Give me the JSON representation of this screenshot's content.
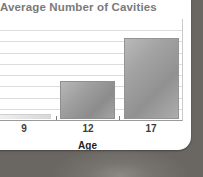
{
  "card": {
    "background_color": "#ffffff",
    "backdrop_color": "#6d6a66"
  },
  "chart_data": {
    "type": "bar",
    "title": "Average Number of Cavities",
    "categories": [
      "9",
      "12",
      "17"
    ],
    "values": [
      0.4,
      3.0,
      6.5
    ],
    "xlabel": "Age",
    "ylabel": "",
    "ylim": [
      0,
      8
    ],
    "grid": true,
    "gridline_count": 8,
    "legend": "none",
    "series": [
      {
        "name": "Average Number of Cavities",
        "values": [
          0.4,
          3.0,
          6.5
        ]
      }
    ],
    "bar_colors": [
      "#e6e6e6",
      "#9f9f9f",
      "#a3a3a3"
    ],
    "axis_color": "#9a9a9a",
    "gridline_color": "#dcdcdc",
    "title_color": "#7a7a7a",
    "label_color": "#1f1f1f"
  }
}
